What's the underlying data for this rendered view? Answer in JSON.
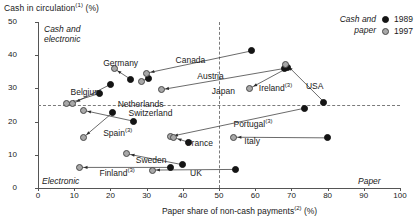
{
  "chart_data": {
    "type": "scatter",
    "title": "Cash in circulation(1) (%)",
    "title_main": "Cash in circulation",
    "title_note": "(1)",
    "title_unit": " (%)",
    "xlabel_main": "Paper share of non-cash payments",
    "xlabel_note": "(2)",
    "xlabel_unit": " (%)",
    "ylabel": "Cash in circulation (%)",
    "xlim": [
      0,
      100
    ],
    "ylim": [
      0,
      50
    ],
    "xticks": [
      0,
      10,
      20,
      30,
      40,
      50,
      60,
      70,
      80,
      90,
      100
    ],
    "yticks": [
      0,
      10,
      20,
      30,
      40,
      50
    ],
    "grid": "dashed reference lines at x=50 and y=25",
    "reference_lines": {
      "vertical_x": 50,
      "horizontal_y": 25
    },
    "legend": {
      "position": "top-right",
      "title_line1": "Cash and",
      "title_line2": "paper",
      "entries": [
        {
          "label": "1989",
          "marker": "filled-black-circle"
        },
        {
          "label": "1997",
          "marker": "filled-grey-circle"
        }
      ]
    },
    "quadrant_labels": [
      {
        "id": "cash-and-electronic",
        "line1": "Cash and",
        "line2": "electronic",
        "corner": "top-left"
      },
      {
        "id": "electronic",
        "line1": "Electronic",
        "line2": "",
        "corner": "bottom-left"
      },
      {
        "id": "paper",
        "line1": "Paper",
        "line2": "",
        "corner": "bottom-right"
      }
    ],
    "series": [
      {
        "name": "1989",
        "marker": "filled-black-circle",
        "color": "#141414"
      },
      {
        "name": "1997",
        "marker": "filled-grey-circle",
        "color": "#a8a8a8"
      }
    ],
    "countries": [
      {
        "name": "Belgium",
        "note": "",
        "label_x": 9,
        "label_y": 28.8,
        "p1989": {
          "x": 17.0,
          "y": 28.5
        },
        "p1997": {
          "x": 8.0,
          "y": 25.4
        }
      },
      {
        "name": "Germany",
        "note": "",
        "label_x": 18,
        "label_y": 37.6,
        "p1989": {
          "x": 25.5,
          "y": 32.8
        },
        "p1997": {
          "x": 21.0,
          "y": 36.0
        }
      },
      {
        "name": "Netherlands",
        "note": "",
        "label_x": 22,
        "label_y": 25.2,
        "p1989": {
          "x": 20.0,
          "y": 31.2
        },
        "p1997": {
          "x": 9.6,
          "y": 25.4
        }
      },
      {
        "name": "Switzerland",
        "note": "",
        "label_x": 25,
        "label_y": 22.6,
        "p1989": {
          "x": 26.5,
          "y": 20.1
        },
        "p1997": {
          "x": 12.5,
          "y": 23.4
        }
      },
      {
        "name": "Spain",
        "note": "(3)",
        "label_x": 18,
        "label_y": 17.0,
        "p1989": {
          "x": 20.5,
          "y": 22.6
        },
        "p1997": {
          "x": 12.5,
          "y": 15.2
        }
      },
      {
        "name": "Austria",
        "note": "",
        "label_x": 44,
        "label_y": 33.8,
        "p1989": {
          "x": 30.5,
          "y": 33.0
        },
        "p1997": {
          "x": 28.5,
          "y": 32.2
        }
      },
      {
        "name": "Canada",
        "note": "",
        "label_x": 38,
        "label_y": 38.7,
        "p1989": {
          "x": 59.0,
          "y": 41.3
        },
        "p1997": {
          "x": 30.0,
          "y": 34.6
        }
      },
      {
        "name": "Japan",
        "note": "",
        "label_x": 48,
        "label_y": 29.2,
        "p1989": {
          "x": 68.0,
          "y": 36.0
        },
        "p1997": {
          "x": 34.0,
          "y": 29.6
        }
      },
      {
        "name": "Ireland",
        "note": "(3)",
        "label_x": 61,
        "label_y": 30.4,
        "p1989": {
          "x": 69.0,
          "y": 36.2
        },
        "p1997": {
          "x": 58.5,
          "y": 30.0
        }
      },
      {
        "name": "USA",
        "note": "",
        "label_x": 74,
        "label_y": 30.6,
        "p1989": {
          "x": 79.0,
          "y": 25.9
        },
        "p1997": {
          "x": 68.5,
          "y": 37.3
        }
      },
      {
        "name": "Portugal",
        "note": "(3)",
        "label_x": 54,
        "label_y": 19.5,
        "p1989": {
          "x": 73.5,
          "y": 24.0
        },
        "p1997": {
          "x": 36.5,
          "y": 15.5
        }
      },
      {
        "name": "Italy",
        "note": "",
        "label_x": 57,
        "label_y": 14.2,
        "p1989": {
          "x": 80.0,
          "y": 15.1
        },
        "p1997": {
          "x": 54.0,
          "y": 15.3
        }
      },
      {
        "name": "France",
        "note": "",
        "label_x": 41,
        "label_y": 13.7,
        "p1989": {
          "x": 41.5,
          "y": 13.8
        },
        "p1997": {
          "x": 37.5,
          "y": 15.2
        }
      },
      {
        "name": "Sweden",
        "note": "",
        "label_x": 27,
        "label_y": 8.4,
        "p1989": {
          "x": 40.0,
          "y": 7.0
        },
        "p1997": {
          "x": 24.5,
          "y": 10.3
        }
      },
      {
        "name": "Finland",
        "note": "(3)",
        "label_x": 17,
        "label_y": 4.8,
        "p1989": {
          "x": 36.5,
          "y": 6.2
        },
        "p1997": {
          "x": 11.5,
          "y": 6.2
        }
      },
      {
        "name": "UK",
        "note": "",
        "label_x": 42,
        "label_y": 4.5,
        "p1989": {
          "x": 54.5,
          "y": 5.6
        },
        "p1997": {
          "x": 31.5,
          "y": 5.4
        }
      }
    ]
  }
}
